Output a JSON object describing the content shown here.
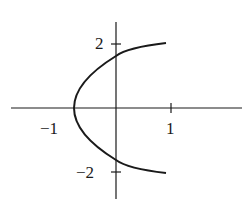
{
  "diagram": {
    "type": "graph-of-curve",
    "axes": {
      "x_ticks": [
        {
          "value": -1,
          "label": "−1"
        },
        {
          "value": 1,
          "label": "1"
        }
      ],
      "y_ticks": [
        {
          "value": 2,
          "label": "2"
        },
        {
          "value": -2,
          "label": "−2"
        }
      ]
    },
    "curve": {
      "shape": "parabola opening right",
      "vertex_x": -0.75,
      "y_axis_crossings": [
        1.6,
        -1.6
      ],
      "x_range": [
        -0.75,
        0.95
      ]
    },
    "colors": {
      "stroke": "#1a1a1a",
      "background": "#ffffff"
    }
  }
}
